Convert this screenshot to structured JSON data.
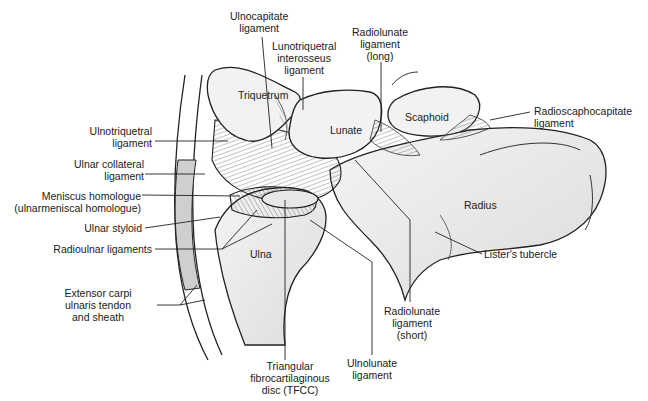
{
  "figure": {
    "structure_labels": {
      "triquetrum": "Triquetrum",
      "lunate": "Lunate",
      "scaphoid": "Scaphoid",
      "radius": "Radius",
      "ulna": "Ulna"
    },
    "callouts": {
      "ulnocapitate": "Ulnocapitate\nligament",
      "lunotriquetral": "Lunotriquetral\ninterosseus\nligament",
      "radiolunate_long": "Radiolunate\nligament\n(long)",
      "radioscaphocapitate": "Radioscaphocapitate\nligament",
      "ulnotriquetral": "Ulnotriquetral\nligament",
      "ulnar_collateral": "Ulnar collateral\nligament",
      "meniscus_homologue": "Meniscus homologue\n(ulnarmeniscal homologue)",
      "ulnar_styloid": "Ulnar styloid",
      "radioulnar": "Radioulnar ligaments",
      "ecu": "Extensor carpi\nulnaris tendon\nand sheath",
      "tfcc": "Triangular\nfibrocartilaginous\ndisc (TFCC)",
      "ulnolunate": "Ulnolunate\nligament",
      "radiolunate_short": "Radiolunate\nligament\n(short)",
      "listers_tubercle": "Lister's tubercle"
    }
  }
}
